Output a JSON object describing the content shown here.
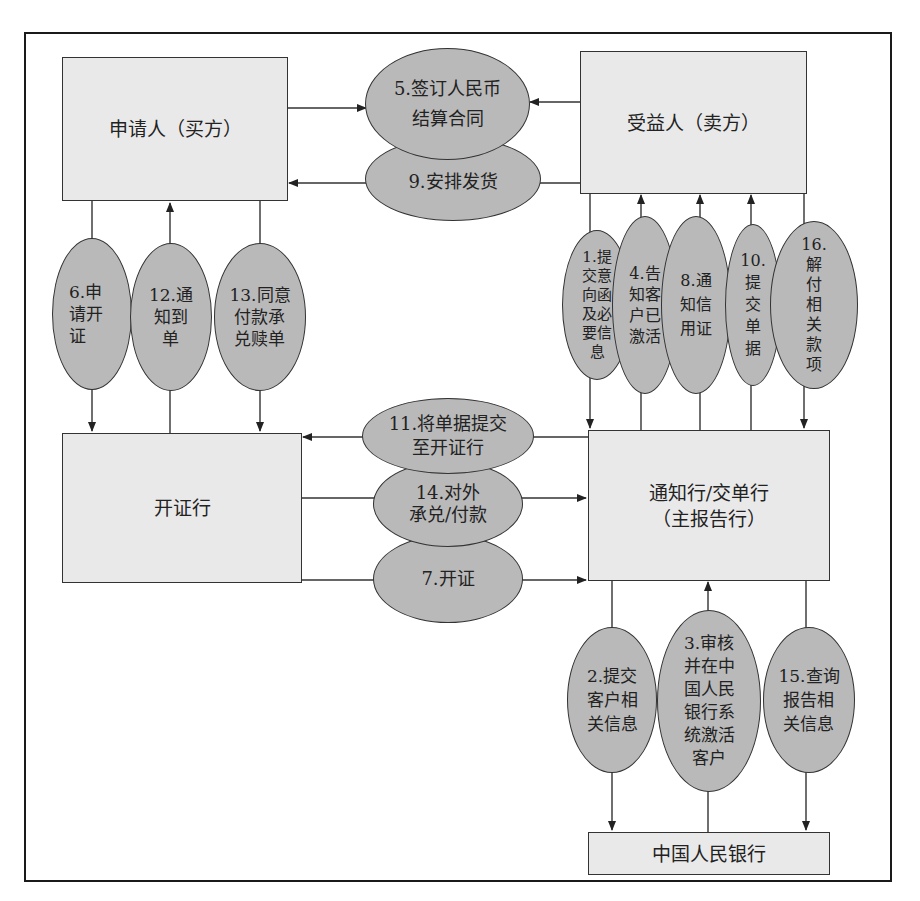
{
  "diagram": {
    "title": "",
    "entities": {
      "applicant": "申请人（买方）",
      "beneficiary": "受益人（卖方）",
      "issuing_bank": "开证行",
      "advising_bank": "通知行/交单行\n（主报告行）",
      "pboc": "中国人民银行"
    },
    "steps": {
      "s1": "1.提\n交意\n向函\n及必\n要信\n息",
      "s2": "2.提交\n客户相\n关信息",
      "s3": "3.审核\n并在中\n国人民\n银行系\n统激活\n客户",
      "s4": "4.告\n知客\n户已\n激活",
      "s5": "5.签订人民币\n结算合同",
      "s6": "6.申\n请开\n证",
      "s7": "7.开证",
      "s8": "8.通\n知信\n用证",
      "s9": "9.安排发货",
      "s10": "10.\n提\n交\n单\n据",
      "s11": "11.将单据提交\n至开证行",
      "s12": "12.通\n知到\n单",
      "s13": "13.同意\n付款承\n兑赎单",
      "s14": "14.对外\n承兑/付款",
      "s15": "15.查询\n报告相\n关信息",
      "s16": "16.\n解\n付\n相\n关\n款\n项"
    },
    "flows": [
      {
        "step": "5",
        "from": "applicant",
        "to": "contract"
      },
      {
        "step": "5",
        "from": "beneficiary",
        "to": "contract"
      },
      {
        "step": "9",
        "from": "beneficiary",
        "to": "applicant"
      },
      {
        "step": "6",
        "from": "applicant",
        "to": "issuing_bank"
      },
      {
        "step": "12",
        "from": "issuing_bank",
        "to": "applicant"
      },
      {
        "step": "13",
        "from": "applicant",
        "to": "issuing_bank"
      },
      {
        "step": "1",
        "from": "beneficiary",
        "to": "advising_bank"
      },
      {
        "step": "4",
        "from": "advising_bank",
        "to": "beneficiary"
      },
      {
        "step": "8",
        "from": "advising_bank",
        "to": "beneficiary"
      },
      {
        "step": "10",
        "from": "beneficiary",
        "to": "advising_bank"
      },
      {
        "step": "16",
        "from": "beneficiary",
        "to": "advising_bank"
      },
      {
        "step": "11",
        "from": "advising_bank",
        "to": "issuing_bank"
      },
      {
        "step": "14",
        "from": "issuing_bank",
        "to": "advising_bank"
      },
      {
        "step": "7",
        "from": "issuing_bank",
        "to": "advising_bank"
      },
      {
        "step": "2",
        "from": "advising_bank",
        "to": "pboc"
      },
      {
        "step": "3",
        "from": "pboc",
        "to": "advising_bank"
      },
      {
        "step": "15",
        "from": "advising_bank",
        "to": "pboc"
      }
    ]
  },
  "colors": {
    "box_fill": "#e9e9e9",
    "ellipse_fill": "#b9b9b9",
    "stroke": "#333333"
  }
}
